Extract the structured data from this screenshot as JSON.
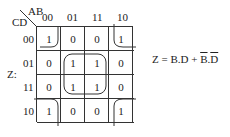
{
  "kmap": {
    "corner_top": "AB",
    "corner_left": "CD",
    "output_label": "Z:",
    "col_headers": [
      "00",
      "01",
      "11",
      "10"
    ],
    "row_headers": [
      "00",
      "01",
      "11",
      "10"
    ],
    "cells": [
      [
        "1",
        "0",
        "0",
        "1"
      ],
      [
        "0",
        "1",
        "1",
        "0"
      ],
      [
        "0",
        "1",
        "1",
        "0"
      ],
      [
        "1",
        "0",
        "0",
        "1"
      ]
    ],
    "groups": [
      {
        "name": "center-quad",
        "cells": "01/11 rows x 01/11 cols",
        "term": "B.D"
      },
      {
        "name": "corner-quad",
        "cells": "four corners",
        "term": "B̄.D̄"
      }
    ]
  },
  "equation": {
    "lhs": "Z = B.D + ",
    "b_bar": "B",
    "dot": ".",
    "d_bar": "D"
  }
}
